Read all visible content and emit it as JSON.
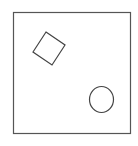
{
  "diagram": {
    "frame": {
      "x": 13.5,
      "y": 12.5,
      "width": 117,
      "height": 121,
      "stroke": "#555555"
    },
    "diamond": {
      "points": "46,32 65,45 52,65 33,52",
      "stroke": "#444444"
    },
    "circle": {
      "cx": 101.5,
      "cy": 99.5,
      "rx": 12,
      "ry": 13,
      "stroke": "#444444"
    }
  }
}
